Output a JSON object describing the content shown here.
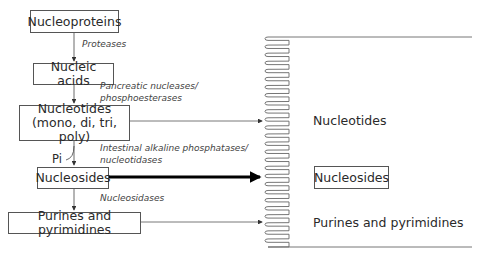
{
  "diagram": {
    "nodes": [
      {
        "id": "nucleoproteins",
        "label": "Nucleoproteins"
      },
      {
        "id": "nucleic_acids",
        "label": "Nucleic acids"
      },
      {
        "id": "nucleotides",
        "label_line1": "Nucleotides",
        "label_line2": "(mono, di, tri, poly)"
      },
      {
        "id": "nucleosides",
        "label": "Nucleosides"
      },
      {
        "id": "purines",
        "label": "Purines and pyrimidines"
      }
    ],
    "enzymes": {
      "proteases": "Proteases",
      "pancreatic_line1": "Pancreatic nucleases/",
      "pancreatic_line2": "phosphoesterases",
      "intestinal_line1": "Intestinal alkaline phosphatases/",
      "intestinal_line2": "nucleotidases",
      "nucleosidases": "Nucleosidases"
    },
    "side_product": "Pi",
    "absorbed": {
      "nucleotides": "Nucleotides",
      "nucleosides": "Nucleosides",
      "purines": "Purines and pyrimidines"
    },
    "colors": {
      "line": "#555555",
      "bold_arrow": "#000000",
      "text": "#2a2a2a"
    }
  }
}
